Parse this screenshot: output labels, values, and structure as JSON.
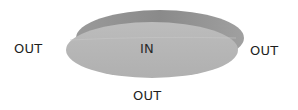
{
  "diagram": {
    "type": "set-boundary illustration",
    "shape": "ellipse-disk",
    "colors": {
      "disk_face": "#b4b4b4",
      "disk_rim": "#8c8c8c",
      "disk_rim_right": "#9c9c9c",
      "text": "#1e1e1e",
      "background": "#ffffff"
    },
    "labels": {
      "inside": "IN",
      "outside_left": "OUT",
      "outside_right": "OUT",
      "outside_bottom": "OUT"
    }
  }
}
